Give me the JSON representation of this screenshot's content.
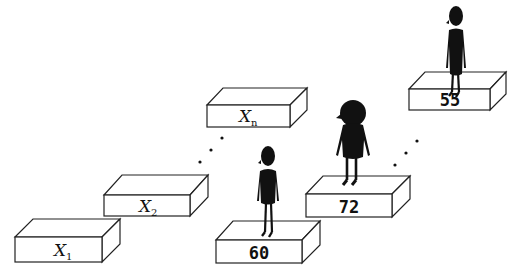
{
  "diagram": {
    "variable_boxes": [
      {
        "id": "x1",
        "label": "X",
        "subscript": "1"
      },
      {
        "id": "x2",
        "label": "X",
        "subscript": "2"
      },
      {
        "id": "xn",
        "label": "X",
        "subscript": "n"
      }
    ],
    "value_boxes": [
      {
        "id": "v1",
        "value": "60"
      },
      {
        "id": "v2",
        "value": "72"
      },
      {
        "id": "vn",
        "value": "55"
      }
    ],
    "ellipsis": "..."
  }
}
